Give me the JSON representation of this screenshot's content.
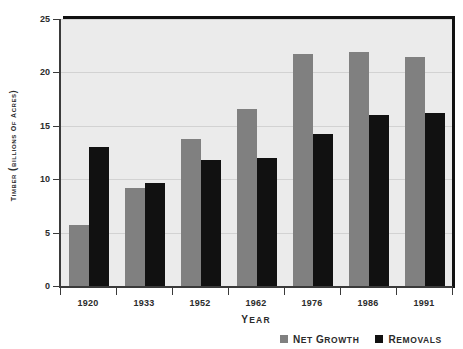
{
  "chart_data": {
    "type": "bar",
    "title": "",
    "xlabel": "YEAR",
    "ylabel": "TIMBER (BILLIONS OF ACRES)",
    "categories": [
      "1920",
      "1933",
      "1952",
      "1962",
      "1976",
      "1986",
      "1991"
    ],
    "series": [
      {
        "name": "NET GROWTH",
        "color": "#808080",
        "values": [
          5.7,
          9.2,
          13.8,
          16.6,
          21.7,
          21.9,
          21.4
        ]
      },
      {
        "name": "REMOVALS",
        "color": "#111111",
        "values": [
          13.0,
          9.6,
          11.8,
          12.0,
          14.2,
          16.0,
          16.2
        ]
      }
    ],
    "ylim": [
      0,
      25
    ],
    "yticks": [
      0,
      5,
      10,
      15,
      20,
      25
    ],
    "ytick_labels": [
      "0",
      "5",
      "10",
      "15",
      "20",
      "25"
    ],
    "grid": true,
    "grid_axis": "y",
    "legend_position": "bottom-right",
    "plot_background": "#ebebeb",
    "figure_background": "#ffffff"
  },
  "legend": {
    "items": [
      {
        "label": "NET GROWTH",
        "swatch": "net-growth"
      },
      {
        "label": "REMOVALS",
        "swatch": "removals"
      }
    ]
  }
}
